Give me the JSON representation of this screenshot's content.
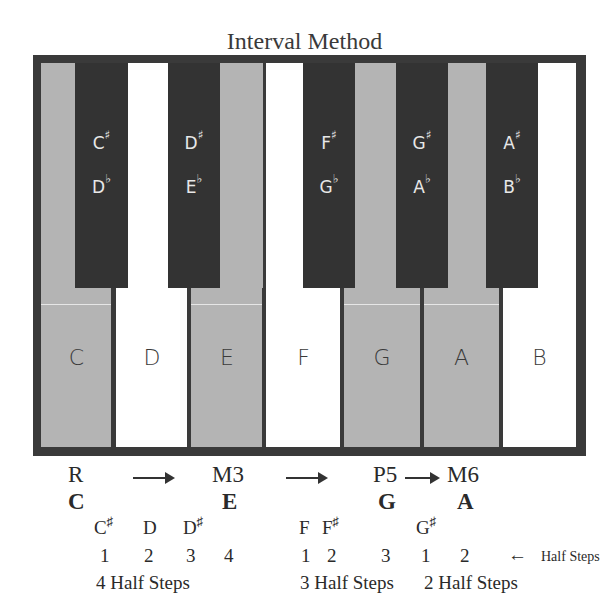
{
  "title": "Interval Method",
  "colors": {
    "frame": "#3a3a3a",
    "black_key": "#333333",
    "highlight_key": "#b4b4b4",
    "white_key": "#ffffff"
  },
  "white_keys": [
    {
      "note": "C",
      "highlighted": true
    },
    {
      "note": "D",
      "highlighted": false
    },
    {
      "note": "E",
      "highlighted": true
    },
    {
      "note": "F",
      "highlighted": false
    },
    {
      "note": "G",
      "highlighted": true
    },
    {
      "note": "A",
      "highlighted": true
    },
    {
      "note": "B",
      "highlighted": false
    }
  ],
  "black_keys": [
    {
      "sharp": "C",
      "flat": "D",
      "sharp_sym": "♯",
      "flat_sym": "♭"
    },
    {
      "sharp": "D",
      "flat": "E",
      "sharp_sym": "♯",
      "flat_sym": "♭"
    },
    {
      "sharp": "F",
      "flat": "G",
      "sharp_sym": "♯",
      "flat_sym": "♭"
    },
    {
      "sharp": "G",
      "flat": "A",
      "sharp_sym": "♯",
      "flat_sym": "♭"
    },
    {
      "sharp": "A",
      "flat": "B",
      "sharp_sym": "♯",
      "flat_sym": "♭"
    }
  ],
  "intervals": {
    "labels": [
      "R",
      "M3",
      "P5",
      "M6"
    ],
    "notes": [
      "C",
      "E",
      "G",
      "A"
    ]
  },
  "steps": {
    "group1": {
      "notes": [
        "C",
        "D",
        "D"
      ],
      "note_sharps": [
        "♯",
        "",
        "♯"
      ],
      "counts": [
        "1",
        "2",
        "3",
        "4"
      ],
      "summary": "4 Half Steps"
    },
    "group2": {
      "notes": [
        "F",
        "F"
      ],
      "note_sharps": [
        "",
        "♯"
      ],
      "counts": [
        "1",
        "2",
        "3"
      ],
      "summary": "3 Half Steps"
    },
    "group3": {
      "notes": [
        "G"
      ],
      "note_sharps": [
        "♯"
      ],
      "counts": [
        "1",
        "2"
      ],
      "summary": "2 Half Steps"
    },
    "legend": {
      "arrow": "←",
      "label": "Half Steps"
    }
  }
}
